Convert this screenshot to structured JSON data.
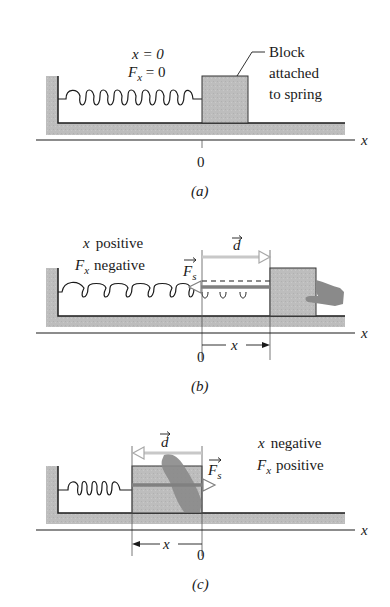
{
  "figure": {
    "panels": [
      {
        "id": "a",
        "caption": "(a)",
        "state_labels": [
          "x = 0",
          "F",
          "x",
          " = 0"
        ],
        "block_label": [
          "Block",
          "attached",
          "to spring"
        ],
        "origin_label": "0",
        "axis_label": "x"
      },
      {
        "id": "b",
        "caption": "(b)",
        "state_labels": [
          "x",
          "positive",
          "F",
          "x",
          "negative"
        ],
        "displacement_vector": "d",
        "force_vector": "F",
        "force_subscript": "s",
        "x_span_label": "x",
        "origin_label": "0",
        "axis_label": "x"
      },
      {
        "id": "c",
        "caption": "(c)",
        "state_labels": [
          "x",
          "negative",
          "F",
          "x",
          "positive"
        ],
        "displacement_vector": "d",
        "force_vector": "F",
        "force_subscript": "s",
        "x_span_label": "x",
        "origin_label": "0",
        "axis_label": "x"
      }
    ],
    "colors": {
      "ink": "#1a1a1a",
      "surface_gray": "#bdbdbd",
      "block_gray": "#b8b8b8",
      "arrow_light": "#c8c8c8",
      "arrow_dark": "#808080",
      "hand": "#8a8a8a"
    }
  }
}
